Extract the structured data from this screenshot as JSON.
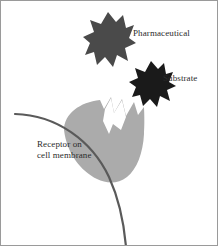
{
  "figure": {
    "width": 218,
    "height": 246,
    "background_color": "#ffffff",
    "border_color": "#9a9a9a"
  },
  "labels": {
    "pharmaceutical": "Pharmaceutical",
    "substrate": "Substrate",
    "receptor_line1": "Receptor on",
    "receptor_line2": "cell membrane"
  },
  "shapes": {
    "pharmaceutical": {
      "name": "pharmaceutical-molecule",
      "color": "#4a4a4a",
      "description": "jagged key-shaped dark gray molecule, upper center"
    },
    "substrate": {
      "name": "substrate-molecule",
      "color": "#1a1a1a",
      "description": "jagged key-shaped near-black molecule, center right"
    },
    "receptor": {
      "name": "receptor-blob",
      "color": "#ababab",
      "description": "light gray rounded receptor blob with jagged notch on upper right"
    },
    "membrane": {
      "name": "cell-membrane-arc",
      "color": "#5a5a5a",
      "stroke_width": 2.2,
      "description": "dark gray curved arc representing the cell membrane"
    }
  }
}
